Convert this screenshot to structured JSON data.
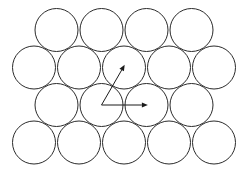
{
  "diagram": {
    "lattice": {
      "type": "hexagonal",
      "rows": [
        {
          "count": 4,
          "offset": "shifted"
        },
        {
          "count": 5,
          "offset": "unshifted"
        },
        {
          "count": 4,
          "offset": "shifted"
        },
        {
          "count": 5,
          "offset": "unshifted"
        }
      ],
      "total_circles": 18
    },
    "vectors": [
      {
        "name": "a1",
        "description": "horizontal lattice vector to right neighbor",
        "angle_deg": 0,
        "length_in_diameters": 1
      },
      {
        "name": "a2",
        "description": "lattice vector to upper-right neighbor",
        "angle_deg": 60,
        "length_in_diameters": 1
      }
    ],
    "vector_origin": {
      "row": 3,
      "index": 2
    },
    "colors": {
      "stroke": "#2b2b2b",
      "background": "#ffffff"
    }
  }
}
